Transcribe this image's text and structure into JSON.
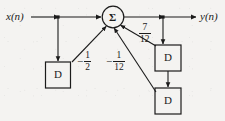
{
  "figure": {
    "type": "signal-flow-graph",
    "background_color": "#f4f3f1",
    "line_color": "#1b1b1b"
  },
  "nodes": {
    "input_label": "x(n)",
    "output_label": "y(n)",
    "summer_label": "Σ",
    "delay_label_1": "D",
    "delay_label_2": "D",
    "delay_label_3": "D"
  },
  "coefficients": [
    {
      "id": "feedforward-7-12",
      "sign": "",
      "numerator": "7",
      "denominator": "12",
      "text": "7/12"
    },
    {
      "id": "feedback-neg-1-2",
      "sign": "−",
      "numerator": "1",
      "denominator": "2",
      "text": "-1/2"
    },
    {
      "id": "feedback-neg-1-12",
      "sign": "−",
      "numerator": "1",
      "denominator": "12",
      "text": "-1/12"
    }
  ]
}
